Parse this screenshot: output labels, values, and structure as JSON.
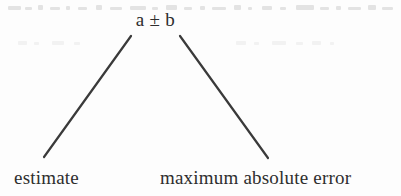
{
  "figure": {
    "kind": "labelled-notation-diagram",
    "width": 401,
    "height": 196,
    "background_color": "#fdfdfd",
    "ink_color": "#3a3a3a",
    "text_color": "#2e2e2e"
  },
  "apex": {
    "expression": "a ± b",
    "operand_left": "a",
    "operator": "±",
    "operand_right": "b"
  },
  "callouts": [
    {
      "id": "estimate",
      "label": "estimate",
      "points_to": "a"
    },
    {
      "id": "maximum-absolute-error",
      "label": "maximum absolute error",
      "points_to": "b"
    }
  ],
  "connectors": [
    {
      "id": "left-connector",
      "from_x": 131,
      "from_y": 36,
      "to_x": 44,
      "to_y": 157,
      "stroke": "#3a3a3a",
      "stroke_width": 2.2
    },
    {
      "id": "right-connector",
      "from_x": 180,
      "from_y": 36,
      "to_x": 268,
      "to_y": 158,
      "stroke": "#3a3a3a",
      "stroke_width": 2.2
    }
  ]
}
